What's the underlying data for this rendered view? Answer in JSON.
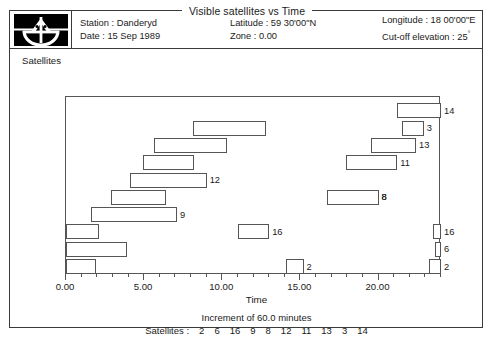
{
  "window": {
    "title": "Visible satellites vs Time"
  },
  "header": {
    "logo_icon": "theodolite-logo-icon",
    "fields": [
      {
        "label_1": "Station : Danderyd",
        "label_2": "Date : 15 Sep 1989"
      },
      {
        "label_1": "Latitude : 59 30'00\"N",
        "label_2": "Zone : 0.00"
      },
      {
        "label_1": "Longitude : 18 00'00\"E",
        "label_2": "Cut-off elevation : 25",
        "label_2_sup": "°"
      }
    ]
  },
  "plot": {
    "y_axis_label": "Satellites",
    "x_axis_label": "Time",
    "increment_note": "Increment of 60.0 minutes",
    "legend_prefix": "Satellites :",
    "legend_satellites": [
      "2",
      "6",
      "16",
      "9",
      "8",
      "12",
      "11",
      "13",
      "3",
      "14"
    ],
    "x_tick_labels": [
      "0.00",
      "5.00",
      "10.00",
      "15.00",
      "20.00"
    ],
    "x_tick_values": [
      0,
      5,
      10,
      15,
      20
    ]
  },
  "chart_data": {
    "type": "bar",
    "title": "Visible satellites vs Time",
    "xlabel": "Time",
    "ylabel": "Satellites",
    "xlim": [
      0,
      24
    ],
    "grid": false,
    "legend": "Satellites : 2 6 16 9 8 12 11 13 3 14",
    "annotations": [
      "Increment of 60.0 minutes"
    ],
    "note": "Horizontal Gantt-style visibility windows. Each row is one satellite (PRN). Values are start/end hours on the 0-24 time axis. Rows are ordered bottom (2) to top (14).",
    "categories": [
      "2",
      "6",
      "16",
      "9",
      "8",
      "12",
      "11",
      "13",
      "3",
      "14"
    ],
    "bars": [
      {
        "satellite": "2",
        "row": 0,
        "label": "2",
        "segments": [
          {
            "start": 0.0,
            "end": 1.9
          },
          {
            "start": 14.1,
            "end": 15.2
          },
          {
            "start": 23.2,
            "end": 24.0
          }
        ]
      },
      {
        "satellite": "6",
        "row": 1,
        "label": "6",
        "segments": [
          {
            "start": 0.0,
            "end": 3.9
          },
          {
            "start": 23.6,
            "end": 24.0
          }
        ]
      },
      {
        "satellite": "16",
        "row": 2,
        "label": "16",
        "segments": [
          {
            "start": 0.0,
            "end": 2.1
          },
          {
            "start": 11.0,
            "end": 13.0
          },
          {
            "start": 23.5,
            "end": 24.0
          }
        ]
      },
      {
        "satellite": "9",
        "row": 3,
        "label": "9",
        "segments": [
          {
            "start": 1.6,
            "end": 7.1
          }
        ]
      },
      {
        "satellite": "8",
        "row": 4,
        "label": "8",
        "segments": [
          {
            "start": 2.9,
            "end": 6.4
          },
          {
            "start": 16.7,
            "end": 20.0
          }
        ]
      },
      {
        "satellite": "12",
        "row": 5,
        "label": "12",
        "segments": [
          {
            "start": 4.1,
            "end": 9.0
          }
        ]
      },
      {
        "satellite": "11",
        "row": 6,
        "label": "11",
        "segments": [
          {
            "start": 4.9,
            "end": 8.2
          },
          {
            "start": 17.9,
            "end": 21.2
          }
        ]
      },
      {
        "satellite": "13",
        "row": 7,
        "label": "13",
        "segments": [
          {
            "start": 5.6,
            "end": 10.3
          },
          {
            "start": 19.5,
            "end": 22.4
          }
        ]
      },
      {
        "satellite": "3",
        "row": 8,
        "label": "3",
        "segments": [
          {
            "start": 8.1,
            "end": 12.8
          },
          {
            "start": 21.5,
            "end": 22.9
          }
        ]
      },
      {
        "satellite": "14",
        "row": 9,
        "label": "14",
        "segments": [
          {
            "start": 21.2,
            "end": 24.0
          }
        ]
      }
    ]
  }
}
